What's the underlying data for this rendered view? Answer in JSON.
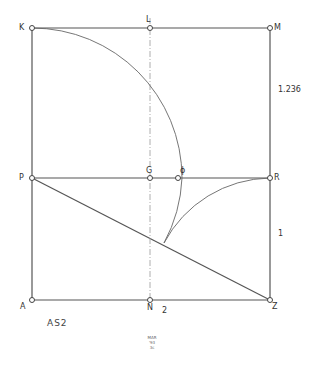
{
  "diagram": {
    "points": {
      "K": {
        "label": "K",
        "x": 32,
        "y": 28
      },
      "L": {
        "label": "L",
        "x": 150,
        "y": 28
      },
      "M": {
        "label": "M",
        "x": 270,
        "y": 28
      },
      "P": {
        "label": "P",
        "x": 32,
        "y": 178
      },
      "G": {
        "label": "G",
        "x": 150,
        "y": 178
      },
      "phi": {
        "label": "ϕ",
        "x": 178,
        "y": 178
      },
      "R": {
        "label": "R",
        "x": 270,
        "y": 178
      },
      "A": {
        "label": "A",
        "x": 32,
        "y": 300
      },
      "N": {
        "label": "N",
        "x": 150,
        "y": 300
      },
      "Z": {
        "label": "Z",
        "x": 270,
        "y": 300
      }
    },
    "dimensions": {
      "upper_right": "1.236",
      "lower_right": "1",
      "bottom": "2"
    },
    "caption": "AS2",
    "signature": [
      "MAR",
      "'93",
      "3c"
    ],
    "stroke_color": "#555555",
    "dash_color": "#999999"
  }
}
